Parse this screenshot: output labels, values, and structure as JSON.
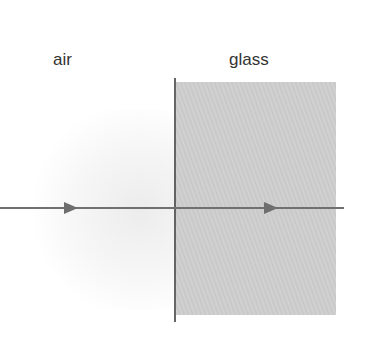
{
  "labels": {
    "left_medium": "air",
    "right_medium": "glass"
  },
  "colors": {
    "ray": "#707070",
    "boundary": "#333333",
    "glass_fill": "#cccccc",
    "text": "#333333"
  },
  "geometry": {
    "ray_y": 208,
    "boundary_x": 175,
    "glass_box": {
      "x": 176,
      "y": 82,
      "width": 160,
      "height": 233
    },
    "arrows": [
      {
        "x": 71,
        "direction": "right"
      },
      {
        "x": 271,
        "direction": "right"
      }
    ]
  }
}
